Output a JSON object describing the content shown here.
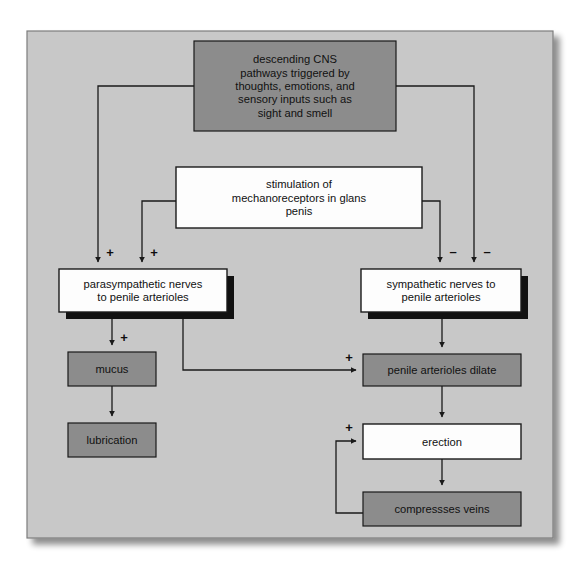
{
  "figure": {
    "kind": "flowchart",
    "title_visible": false,
    "canvas": {
      "width": 585,
      "height": 583,
      "background": "#ffffff"
    },
    "panel": {
      "x": 27,
      "y": 31,
      "width": 526,
      "height": 507,
      "fill": "#c8c8c8",
      "border": "#7d7d7d",
      "shadow": "#b4b4b4"
    }
  },
  "palette": {
    "panel_background": "#c8c8c8",
    "gray_box_fill": "#8c8c8c",
    "white_box_fill": "#fdfdfd",
    "box_border": "#1a1a1a",
    "drop_shadow": "#111111",
    "line": "#1a1a1a",
    "text": "#111111"
  },
  "nodes": [
    {
      "id": "cns",
      "name": "descending-cns-pathways-box",
      "style": "gray",
      "shadow": false,
      "x": 194,
      "y": 41,
      "width": 202,
      "height": 90,
      "lines": [
        "descending CNS",
        "pathways triggered by",
        "thoughts, emotions, and",
        "sensory inputs such as",
        "sight and smell"
      ],
      "text": "descending CNS pathways triggered by thoughts, emotions, and sensory inputs such as sight and smell"
    },
    {
      "id": "mechano",
      "name": "stimulation-mechanoreceptors-box",
      "style": "white",
      "shadow": false,
      "x": 176,
      "y": 167,
      "width": 246,
      "height": 61,
      "lines": [
        "stimulation of",
        "mechanoreceptors in glans",
        "penis"
      ],
      "text": "stimulation of mechanoreceptors in glans penis"
    },
    {
      "id": "para",
      "name": "parasympathetic-nerves-box",
      "style": "white",
      "shadow": true,
      "x": 59,
      "y": 269,
      "width": 168,
      "height": 43,
      "lines": [
        "parasympathetic nerves",
        "to penile arterioles"
      ],
      "text": "parasympathetic nerves to penile arterioles"
    },
    {
      "id": "symp",
      "name": "sympathetic-nerves-box",
      "style": "white",
      "shadow": true,
      "x": 361,
      "y": 269,
      "width": 160,
      "height": 43,
      "lines": [
        "sympathetic nerves to",
        "penile arterioles"
      ],
      "text": "sympathetic nerves to penile arterioles"
    },
    {
      "id": "mucus",
      "name": "mucus-box",
      "style": "gray",
      "shadow": false,
      "x": 68,
      "y": 352,
      "width": 88,
      "height": 34,
      "lines": [
        "mucus"
      ],
      "text": "mucus"
    },
    {
      "id": "lubrication",
      "name": "lubrication-box",
      "style": "gray",
      "shadow": false,
      "x": 68,
      "y": 423,
      "width": 88,
      "height": 34,
      "lines": [
        "lubrication"
      ],
      "text": "lubrication"
    },
    {
      "id": "dilate",
      "name": "penile-arterioles-dilate-box",
      "style": "gray",
      "shadow": false,
      "x": 363,
      "y": 354,
      "width": 158,
      "height": 32,
      "lines": [
        "penile arterioles dilate"
      ],
      "text": "penile arterioles dilate"
    },
    {
      "id": "erection",
      "name": "erection-box",
      "style": "white",
      "shadow": false,
      "x": 363,
      "y": 424,
      "width": 158,
      "height": 35,
      "lines": [
        "erection"
      ],
      "text": "erection"
    },
    {
      "id": "veins",
      "name": "compressses-veins-box",
      "style": "gray",
      "shadow": false,
      "x": 363,
      "y": 492,
      "width": 158,
      "height": 34,
      "lines": [
        "compressses veins"
      ],
      "text": "compressses veins"
    }
  ],
  "edges": [
    {
      "id": "cns-to-para",
      "name": "edge-cns-to-parasympathetic",
      "from": "cns",
      "to": "para",
      "sign": "+",
      "points": "194,86 98,86 98,262",
      "arrow_at": [
        98,
        268
      ]
    },
    {
      "id": "cns-to-symp",
      "name": "edge-cns-to-sympathetic",
      "from": "cns",
      "to": "symp",
      "sign": "-",
      "points": "396,86 474,86 474,262",
      "arrow_at": [
        474,
        268
      ]
    },
    {
      "id": "mechano-to-para",
      "name": "edge-mechanoreceptors-to-parasympathetic",
      "from": "mechano",
      "to": "para",
      "sign": "+",
      "points": "176,201 142,201 142,262",
      "arrow_at": [
        142,
        268
      ]
    },
    {
      "id": "mechano-to-symp",
      "name": "edge-mechanoreceptors-to-sympathetic",
      "from": "mechano",
      "to": "symp",
      "sign": "-",
      "points": "422,201 440,201 440,262",
      "arrow_at": [
        440,
        268
      ]
    },
    {
      "id": "para-to-mucus",
      "name": "edge-parasympathetic-to-mucus",
      "from": "para",
      "to": "mucus",
      "sign": "+",
      "points": "112,312 112,345",
      "arrow_at": [
        112,
        351
      ]
    },
    {
      "id": "para-to-dilate",
      "name": "edge-parasympathetic-to-dilate",
      "from": "para",
      "to": "dilate",
      "sign": "+",
      "points": "183,312 183,370 356,370",
      "arrow_at": [
        362,
        370
      ]
    },
    {
      "id": "mucus-to-lubrication",
      "name": "edge-mucus-to-lubrication",
      "from": "mucus",
      "to": "lubrication",
      "sign": "",
      "points": "112,386 112,416",
      "arrow_at": [
        112,
        422
      ]
    },
    {
      "id": "symp-to-dilate",
      "name": "edge-sympathetic-to-dilate",
      "from": "symp",
      "to": "dilate",
      "sign": "",
      "points": "442,312 442,347",
      "arrow_at": [
        442,
        353
      ]
    },
    {
      "id": "dilate-to-erection",
      "name": "edge-dilate-to-erection",
      "from": "dilate",
      "to": "erection",
      "sign": "",
      "points": "442,386 442,417",
      "arrow_at": [
        442,
        423
      ]
    },
    {
      "id": "erection-to-veins",
      "name": "edge-erection-to-compressses-veins",
      "from": "erection",
      "to": "veins",
      "sign": "",
      "points": "442,459 442,485",
      "arrow_at": [
        442,
        491
      ]
    },
    {
      "id": "veins-to-erection",
      "name": "edge-compressses-veins-feedback-to-erection",
      "from": "veins",
      "to": "erection",
      "sign": "+",
      "points": "363,513 336,513 336,441 356,441",
      "arrow_at": [
        362,
        441
      ]
    }
  ],
  "signs": [
    {
      "id": "sign-cns-para",
      "name": "plus-sign-cns-to-parasympathetic",
      "symbol": "+",
      "x": 110,
      "y": 257
    },
    {
      "id": "sign-mechano-para",
      "name": "plus-sign-mechanoreceptors-to-parasympathetic",
      "symbol": "+",
      "x": 154,
      "y": 257
    },
    {
      "id": "sign-mechano-symp",
      "name": "minus-sign-mechanoreceptors-to-sympathetic",
      "symbol": "–",
      "x": 453,
      "y": 256
    },
    {
      "id": "sign-cns-symp",
      "name": "minus-sign-cns-to-sympathetic",
      "symbol": "–",
      "x": 487,
      "y": 256
    },
    {
      "id": "sign-para-mucus",
      "name": "plus-sign-parasympathetic-to-mucus",
      "symbol": "+",
      "x": 124,
      "y": 342
    },
    {
      "id": "sign-para-dilate",
      "name": "plus-sign-parasympathetic-to-dilate",
      "symbol": "+",
      "x": 349,
      "y": 362
    },
    {
      "id": "sign-veins-erection",
      "name": "plus-sign-feedback-to-erection",
      "symbol": "+",
      "x": 349,
      "y": 432
    }
  ]
}
